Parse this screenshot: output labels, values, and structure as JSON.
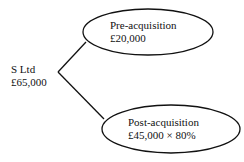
{
  "diagram": {
    "root": {
      "name": "S Ltd",
      "value": "£65,000"
    },
    "branches": [
      {
        "title": "Pre-acquisition",
        "value": "£20,000"
      },
      {
        "title": "Post-acquisition",
        "value": "£45,000 × 80%"
      }
    ],
    "colors": {
      "stroke": "#111111",
      "background": "#ffffff"
    }
  }
}
